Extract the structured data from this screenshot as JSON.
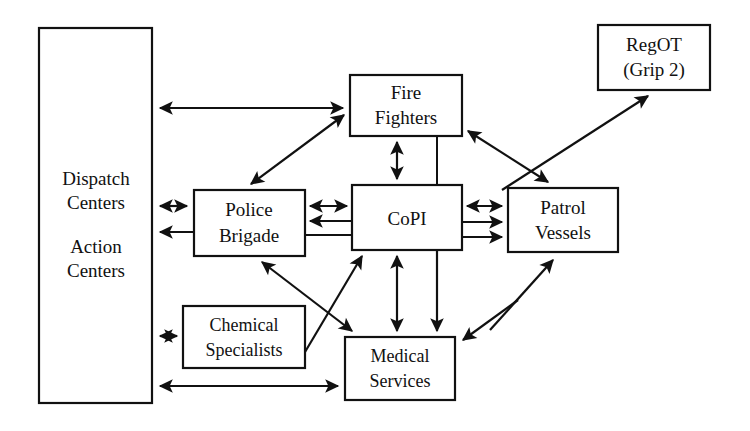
{
  "diagram": {
    "background_color": "#ffffff",
    "line_color": "#111111",
    "box_fill": "#ffffff",
    "nodes": [
      {
        "id": "dispatch_action_centers",
        "lines": [
          "Dispatch",
          "Centers",
          "",
          "Action",
          "Centers"
        ],
        "label_line_1": "Dispatch",
        "label_line_2": "Centers",
        "label_line_3": "Action",
        "label_line_4": "Centers",
        "x": 39,
        "y": 28,
        "w": 113,
        "h": 375
      },
      {
        "id": "fire_fighters",
        "label_line_1": "Fire",
        "label_line_2": "Fighters",
        "x": 350,
        "y": 75,
        "w": 112,
        "h": 61
      },
      {
        "id": "regot_grip2",
        "label_line_1": "RegOT",
        "label_line_2": "(Grip 2)",
        "x": 598,
        "y": 25,
        "w": 112,
        "h": 65
      },
      {
        "id": "police_brigade",
        "label_line_1": "Police",
        "label_line_2": "Brigade",
        "x": 194,
        "y": 190,
        "w": 111,
        "h": 66
      },
      {
        "id": "copi",
        "label_line_1": "CoPI",
        "label_line_2": "",
        "x": 352,
        "y": 185,
        "w": 110,
        "h": 65
      },
      {
        "id": "patrol_vessels",
        "label_line_1": "Patrol",
        "label_line_2": "Vessels",
        "x": 508,
        "y": 188,
        "w": 110,
        "h": 64
      },
      {
        "id": "chemical_specialists",
        "label_line_1": "Chemical",
        "label_line_2": "Specialists",
        "x": 183,
        "y": 306,
        "w": 122,
        "h": 62
      },
      {
        "id": "medical_services",
        "label_line_1": "Medical",
        "label_line_2": "Services",
        "x": 345,
        "y": 337,
        "w": 110,
        "h": 63
      }
    ],
    "edges": [
      {
        "id": "centers-to-firefighters",
        "from": "dispatch_action_centers",
        "to": "fire_fighters",
        "arrows": "end"
      },
      {
        "id": "centers-police-bidirectional",
        "from": "dispatch_action_centers",
        "to": "police_brigade",
        "arrows": "both"
      },
      {
        "id": "police-to-centers",
        "from": "police_brigade",
        "to": "dispatch_action_centers",
        "arrows": "end"
      },
      {
        "id": "centers-chemical-bidirectional",
        "from": "dispatch_action_centers",
        "to": "chemical_specialists",
        "arrows": "both"
      },
      {
        "id": "centers-medical-bidirectional",
        "from": "medical_services",
        "to": "dispatch_action_centers",
        "arrows": "both"
      },
      {
        "id": "police-firefighters-bidirectional",
        "from": "police_brigade",
        "to": "fire_fighters",
        "arrows": "both"
      },
      {
        "id": "police-copi-bidirectional",
        "from": "police_brigade",
        "to": "copi",
        "arrows": "both"
      },
      {
        "id": "copi-to-police",
        "from": "copi",
        "to": "police_brigade",
        "arrows": "end"
      },
      {
        "id": "police-copi-plain",
        "from": "police_brigade",
        "to": "copi",
        "arrows": "none"
      },
      {
        "id": "firefighters-copi-bidirectional",
        "from": "fire_fighters",
        "to": "copi",
        "arrows": "both"
      },
      {
        "id": "firefighters-copi-plain",
        "from": "fire_fighters",
        "to": "copi",
        "arrows": "none"
      },
      {
        "id": "copi-patrol-bidirectional",
        "from": "copi",
        "to": "patrol_vessels",
        "arrows": "both"
      },
      {
        "id": "copi-to-patrol-1",
        "from": "copi",
        "to": "patrol_vessels",
        "arrows": "end"
      },
      {
        "id": "copi-to-patrol-2",
        "from": "copi",
        "to": "patrol_vessels",
        "arrows": "end"
      },
      {
        "id": "patrol-to-regot",
        "from": "patrol_vessels",
        "to": "regot_grip2",
        "arrows": "end"
      },
      {
        "id": "firefighters-patrol-bidirectional",
        "from": "fire_fighters",
        "to": "patrol_vessels",
        "arrows": "both"
      },
      {
        "id": "copi-medical-bidirectional",
        "from": "copi",
        "to": "medical_services",
        "arrows": "both"
      },
      {
        "id": "copi-to-medical",
        "from": "copi",
        "to": "medical_services",
        "arrows": "end"
      },
      {
        "id": "police-medical-bidirectional",
        "from": "police_brigade",
        "to": "medical_services",
        "arrows": "both"
      },
      {
        "id": "medical-to-copi",
        "from": "medical_services",
        "to": "copi",
        "arrows": "end"
      },
      {
        "id": "patrol-to-medical",
        "from": "patrol_vessels",
        "to": "medical_services",
        "arrows": "end"
      },
      {
        "id": "medical-to-patrol",
        "from": "medical_services",
        "to": "patrol_vessels",
        "arrows": "end"
      }
    ]
  }
}
